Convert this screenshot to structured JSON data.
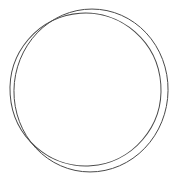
{
  "figure": {
    "title": "Two overlapping circles outline drawing",
    "type": "line-drawing",
    "canvas": {
      "width": 178,
      "height": 183,
      "background_color": "#ffffff"
    },
    "stroke": {
      "color": "#4a4a4a",
      "width": 1,
      "fill": "none"
    },
    "shapes": [
      {
        "name": "circle-a",
        "label": "Inner circle (taller, shifted left)",
        "kind": "ellipse",
        "cx": 85.5,
        "cy": 89.5,
        "rx": 75.5,
        "ry": 76.5,
        "rotation_deg": -4,
        "bounds": {
          "top": 13,
          "bottom": 166,
          "left": 10,
          "right": 161
        }
      },
      {
        "name": "circle-b",
        "label": "Outer circle (wider, shifted right)",
        "kind": "ellipse",
        "cx": 91.0,
        "cy": 90.5,
        "rx": 77.0,
        "ry": 81.5,
        "rotation_deg": 6,
        "bounds": {
          "top": 9,
          "bottom": 172,
          "left": 14,
          "right": 168
        }
      }
    ],
    "intersections": [
      {
        "name": "crossing-top-left",
        "x": 40,
        "y": 37
      },
      {
        "name": "crossing-top-right",
        "x": 140,
        "y": 38
      },
      {
        "name": "crossing-bottom-left",
        "x": 40,
        "y": 146
      },
      {
        "name": "crossing-bottom-right",
        "x": 141,
        "y": 147
      }
    ]
  }
}
